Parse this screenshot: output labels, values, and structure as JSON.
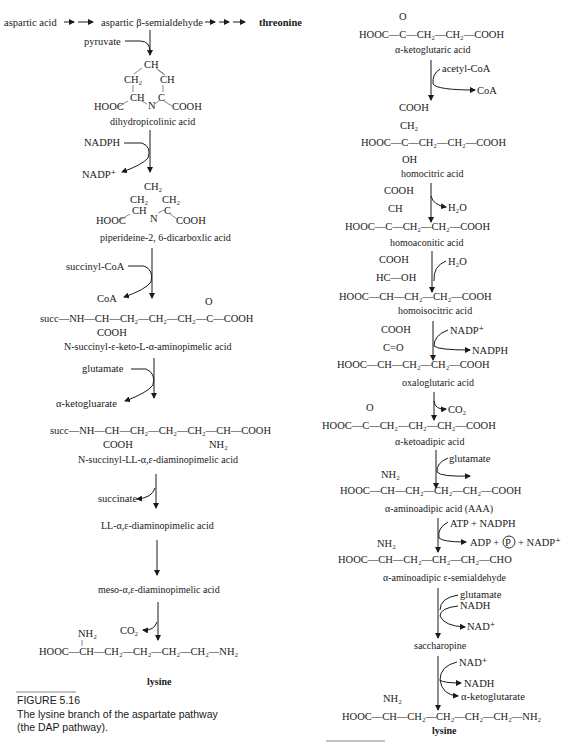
{
  "left_pathway": {
    "header": {
      "start": "aspartic acid",
      "intermediate": "aspartic β-semialdehyde",
      "end": "threonine"
    },
    "steps": [
      {
        "cosubstrate_in": "pyruvate"
      },
      {
        "compound": "dihydropicolinic acid",
        "structure": {
          "top": "CH",
          "ch2": "CH₂",
          "ch_right": "CH",
          "ch_left": "CH",
          "n": "N",
          "c": "C",
          "left_group": "HOOC",
          "right_group": "COOH"
        }
      },
      {
        "cosubstrate_in": "NADPH",
        "cosubstrate_out": "NADP⁺"
      },
      {
        "compound": "piperideine-2, 6-dicarboxlic acid",
        "structure": {
          "top": "CH₂",
          "ch2_left": "CH₂",
          "ch2_right": "CH₂",
          "ch": "CH",
          "n": "N",
          "c": "C",
          "left_group": "HOOC",
          "right_group": "COOH"
        }
      },
      {
        "cosubstrate_in": "succinyl-CoA",
        "cosubstrate_out": "CoA"
      },
      {
        "compound": "N-succinyl-ε-keto-L-α-aminopimelic acid",
        "formula": "succ—NH—CH—CH₂—CH₂—CH₂—C—COOH",
        "sub_group": "COOH",
        "keto": "O"
      },
      {
        "cosubstrate_in": "glutamate",
        "cosubstrate_out": "α-ketogluarate"
      },
      {
        "compound": "N-succinyl-LL-α,ε-diaminopimelic acid",
        "formula": "succ—NH—CH—CH₂—CH₂—CH₂—CH—COOH",
        "sub_group": "COOH",
        "amino": "NH₂"
      },
      {
        "cosubstrate_out": "succinate"
      },
      {
        "compound": "LL-α,ε-diaminopimelic acid"
      },
      {
        "compound": "meso-α,ε-diaminopimelic acid"
      },
      {
        "cosubstrate_out": "CO₂"
      },
      {
        "compound": "lysine",
        "formula": "HOOC—CH—CH₂—CH₂—CH₂—CH₂—NH₂",
        "amino": "NH₂"
      }
    ],
    "figure": {
      "label": "FIGURE 5.16",
      "caption_line1": "The lysine branch of the aspartate pathway",
      "caption_line2": "(the DAP pathway)."
    }
  },
  "right_pathway": {
    "steps": [
      {
        "compound": "α-ketoglutaric acid",
        "formula": "HOOC—C—CH₂—CH₂—COOH",
        "keto": "O"
      },
      {
        "cosubstrate_in": "acetyl-CoA",
        "cosubstrate_out": "CoA"
      },
      {
        "compound": "homocitric acid",
        "formula": "HOOC—C—CH₂—CH₂—COOH",
        "top1": "COOH",
        "top2": "CH₂",
        "bottom": "OH"
      },
      {
        "cosubstrate_out": "H₂O"
      },
      {
        "compound": "homoaconitic acid",
        "formula": "HOOC—C—CH₂—CH₂—COOH",
        "top1": "COOH",
        "top2": "CH"
      },
      {
        "cosubstrate_in": "H₂O"
      },
      {
        "compound": "homoisocitric acid",
        "formula": "HOOC—CH—CH₂—CH₂—COOH",
        "top1": "COOH",
        "top2": "HC—OH"
      },
      {
        "cosubstrate_in": "NADP⁺",
        "cosubstrate_out": "NADPH"
      },
      {
        "compound": "oxaloglutaric acid",
        "formula": "HOOC—CH—CH₂—CH₂—COOH",
        "top1": "COOH",
        "top2": "C=O"
      },
      {
        "cosubstrate_out": "CO₂"
      },
      {
        "compound": "α-ketoadipic acid",
        "formula": "HOOC—C—CH₂—CH₂—CH₂—COOH",
        "keto": "O"
      },
      {
        "cosubstrate_in": "glutamate"
      },
      {
        "compound": "α-aminoadipic acid (AAA)",
        "formula": "HOOC—CH—CH₂—CH₂—CH₂—COOH",
        "amino": "NH₂"
      },
      {
        "cosubstrate_in": "ATP + NADPH",
        "cosubstrate_out_1": "ADP +",
        "cosubstrate_out_p": "P",
        "cosubstrate_out_2": "+ NADP⁺"
      },
      {
        "compound": "α-aminoadipic ε-semialdehyde",
        "formula": "HOOC—CH—CH₂—CH₂—CH₂—CHO",
        "amino": "NH₂"
      },
      {
        "cosubstrate_in_1": "glutamate",
        "cosubstrate_in_2": "NADH",
        "cosubstrate_out": "NAD⁺"
      },
      {
        "compound": "saccharopine"
      },
      {
        "cosubstrate_in": "NAD⁺",
        "cosubstrate_out_1": "NADH",
        "cosubstrate_out_2": "α-ketoglutarate"
      },
      {
        "compound": "lysine",
        "formula": "HOOC—CH—CH₂—CH₂—CH₂—CH₂—NH₂",
        "amino": "NH₂"
      }
    ],
    "figure": {
      "label_partial": "FIGURE 5.17"
    }
  }
}
